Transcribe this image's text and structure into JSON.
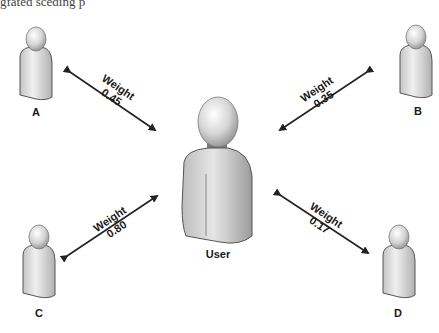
{
  "top_fragment": "gfated sceding p",
  "center": {
    "label": "User"
  },
  "nodes": [
    {
      "id": "A",
      "label": "A"
    },
    {
      "id": "B",
      "label": "B"
    },
    {
      "id": "C",
      "label": "C"
    },
    {
      "id": "D",
      "label": "D"
    }
  ],
  "edges": [
    {
      "from": "User",
      "to": "A",
      "title": "Weight",
      "weight": "0.45"
    },
    {
      "from": "User",
      "to": "B",
      "title": "Weight",
      "weight": "0.35"
    },
    {
      "from": "User",
      "to": "C",
      "title": "Weight",
      "weight": "0.80"
    },
    {
      "from": "User",
      "to": "D",
      "title": "Weight",
      "weight": "0.17"
    }
  ],
  "colors": {
    "figure_fill": "#d8d8d8",
    "figure_outline": "#444444",
    "arrow": "#222222",
    "text": "#1a1a1a"
  }
}
